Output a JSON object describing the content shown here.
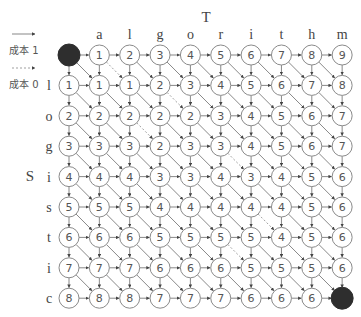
{
  "diagram": {
    "title_top": "T",
    "title_side": "S",
    "columns": [
      "a",
      "l",
      "g",
      "o",
      "r",
      "i",
      "t",
      "h",
      "m"
    ],
    "rows": [
      "l",
      "o",
      "g",
      "i",
      "s",
      "t",
      "i",
      "c"
    ],
    "legend": [
      {
        "style": "solid",
        "label": "成本 1"
      },
      {
        "style": "dashed",
        "label": "成本 0"
      }
    ],
    "start_node": "filled",
    "end_node": "filled",
    "grid": [
      [
        null,
        1,
        2,
        3,
        4,
        5,
        6,
        7,
        8,
        9
      ],
      [
        1,
        1,
        1,
        2,
        3,
        4,
        5,
        6,
        7,
        8
      ],
      [
        2,
        2,
        2,
        2,
        2,
        3,
        4,
        5,
        6,
        7
      ],
      [
        3,
        3,
        3,
        2,
        3,
        3,
        4,
        5,
        6,
        7
      ],
      [
        4,
        4,
        4,
        3,
        3,
        4,
        3,
        4,
        5,
        6
      ],
      [
        5,
        5,
        5,
        4,
        4,
        4,
        4,
        4,
        5,
        6
      ],
      [
        6,
        6,
        6,
        5,
        5,
        5,
        5,
        4,
        5,
        6
      ],
      [
        7,
        7,
        7,
        6,
        6,
        6,
        5,
        5,
        5,
        6
      ],
      [
        8,
        8,
        8,
        7,
        7,
        7,
        6,
        6,
        6,
        null
      ]
    ],
    "colors": {
      "node_stroke": "#8a8a8a",
      "node_fill": "#ffffff",
      "terminal_fill": "#2e2e2e",
      "edge": "#555555"
    }
  }
}
